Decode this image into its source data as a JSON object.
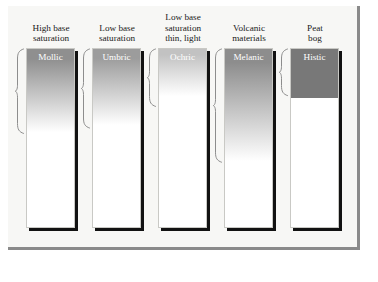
{
  "figure": {
    "panel_background": "#f7f7f5",
    "panel_border_color": "#8a8a8a",
    "shadow_color": "#121212",
    "label_text_color": "#ffffff",
    "header_text_color": "#1a1a1a",
    "brace_color": "#8d8d8d"
  },
  "columns": [
    {
      "id": "mollic",
      "header_lines": [
        "High base",
        "saturation"
      ],
      "horizon_label": "Mollic",
      "top_color": "#8f8f8f",
      "bottom_color": "#ffffff",
      "fill_depth_pct": 46,
      "gradient_type": "gradient",
      "brace_depth_pct": 48,
      "x": 18
    },
    {
      "id": "umbric",
      "header_lines": [
        "Low base",
        "saturation"
      ],
      "horizon_label": "Umbric",
      "top_color": "#9c9c9c",
      "bottom_color": "#ffffff",
      "fill_depth_pct": 42,
      "gradient_type": "gradient",
      "brace_depth_pct": 45,
      "x": 84
    },
    {
      "id": "ochric",
      "header_lines": [
        "Low base",
        "saturation",
        "thin, light"
      ],
      "horizon_label": "Ochric",
      "top_color": "#c2c2c2",
      "bottom_color": "#ffffff",
      "fill_depth_pct": 26,
      "gradient_type": "gradient",
      "brace_depth_pct": 33,
      "x": 150
    },
    {
      "id": "melanic",
      "header_lines": [
        "Volcanic",
        "materials"
      ],
      "horizon_label": "Melanic",
      "top_color": "#8d8d8d",
      "bottom_color": "#ffffff",
      "fill_depth_pct": 62,
      "gradient_type": "gradient",
      "brace_depth_pct": 64,
      "x": 216
    },
    {
      "id": "histic",
      "header_lines": [
        "Peat",
        "bog"
      ],
      "horizon_label": "Histic",
      "top_color": "#787878",
      "bottom_color": "#787878",
      "fill_depth_pct": 27,
      "gradient_type": "solid",
      "brace_depth_pct": 27,
      "x": 282
    }
  ]
}
